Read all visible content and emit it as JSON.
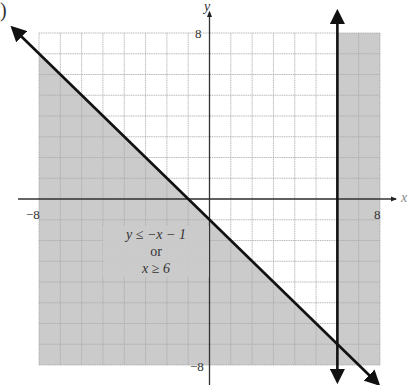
{
  "panel_label": ")",
  "chart_data": {
    "type": "inequality-graph",
    "title": "",
    "xlabel": "x",
    "ylabel": "y",
    "xlim": [
      -8,
      8
    ],
    "ylim": [
      -8,
      8
    ],
    "grid": true,
    "grid_step": 1,
    "tick_labels": {
      "x_min": "−8",
      "x_max": "8",
      "y_min": "−8",
      "y_max": "8"
    },
    "lines": [
      {
        "name": "y = -x - 1",
        "slope": -1,
        "intercept": -1,
        "style": "solid",
        "arrows": "both",
        "endpoints": [
          [
            -9,
            8
          ],
          [
            8,
            -9
          ]
        ]
      },
      {
        "name": "x = 6",
        "vertical_x": 6,
        "style": "solid",
        "arrows": "both"
      }
    ],
    "shaded_regions": [
      {
        "inequality": "y ≤ -x - 1",
        "description": "below and left of diagonal"
      },
      {
        "inequality": "x ≥ 6",
        "description": "right of vertical line"
      }
    ],
    "annotation": {
      "line1": "y ≤ −x − 1",
      "line2": "or",
      "line3": "x ≥ 6",
      "position": [
        -4,
        -1.8
      ]
    },
    "colors": {
      "shade": "#cbcbcb",
      "grid": "#a8a8a8",
      "line": "#111111",
      "axis": "#333333"
    }
  }
}
